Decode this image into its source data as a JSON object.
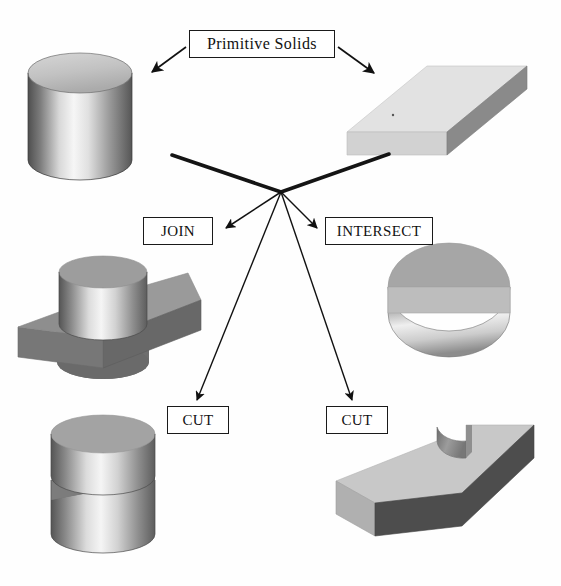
{
  "diagram": {
    "title": "Primitive Solids",
    "background_color": "#fefefe",
    "line_color": "#1a1a1a"
  },
  "labels": {
    "primitive_solids": "Primitive Solids",
    "join": "JOIN",
    "intersect": "INTERSECT",
    "cut_left": "CUT",
    "cut_right": "CUT"
  },
  "shapes": {
    "cylinder_primitive": {
      "name": "cylinder",
      "role": "primitive-solid-a",
      "position": "top-left"
    },
    "block_primitive": {
      "name": "rectangular-block",
      "role": "primitive-solid-b",
      "position": "top-right"
    },
    "join_result": {
      "name": "cylinder-on-block-union",
      "role": "join-result",
      "position": "middle-left"
    },
    "intersect_result": {
      "name": "half-cylinder-wedge",
      "role": "intersect-result",
      "position": "middle-right"
    },
    "cut_left_result": {
      "name": "cylinder-with-slot",
      "role": "cut-result-a",
      "position": "bottom-left"
    },
    "cut_right_result": {
      "name": "block-with-circular-notch",
      "role": "cut-result-b",
      "position": "bottom-right"
    }
  },
  "colors": {
    "face_top_light": "#e2e2e2",
    "face_side_mid": "#8a8a8a",
    "face_front_dark": "#4d4d4d",
    "face_highlight": "#f4f4f4",
    "outline": "#1a1a1a",
    "arrow": "#111111"
  },
  "connectors": {
    "primitive_to_cylinder": "arrow from Primitive Solids box down-left to cylinder",
    "primitive_to_block": "arrow from Primitive Solids box down-right to block",
    "cylinder_to_hub": "thick line from cylinder to central hub",
    "block_to_hub": "thick line from block to central hub",
    "hub_to_join": "arrow from hub down-left to JOIN",
    "hub_to_intersect": "arrow from hub down-right to INTERSECT",
    "hub_to_cut_left": "arrow from hub down to left CUT",
    "hub_to_cut_right": "arrow from hub down to right CUT"
  }
}
